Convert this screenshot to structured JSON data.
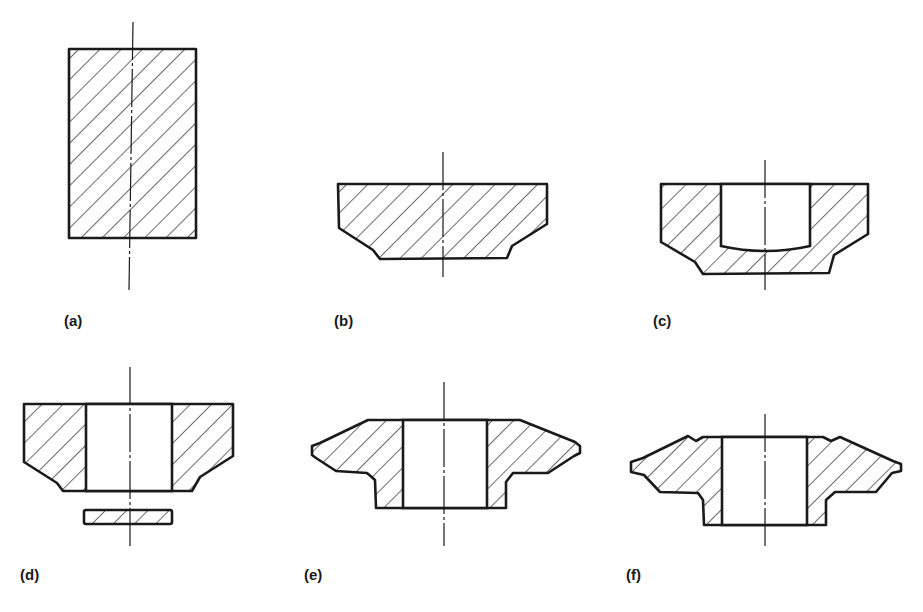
{
  "figure": {
    "panels": [
      {
        "id": "a",
        "label": "(a)",
        "stage": "billet"
      },
      {
        "id": "b",
        "label": "(b)",
        "stage": "upset blank"
      },
      {
        "id": "c",
        "label": "(c)",
        "stage": "pierced blank"
      },
      {
        "id": "d",
        "label": "(d)",
        "stage": "punched out with slug"
      },
      {
        "id": "e",
        "label": "(e)",
        "stage": "flanged forging"
      },
      {
        "id": "f",
        "label": "(f)",
        "stage": "finished forging"
      }
    ],
    "colors": {
      "ink": "#1a1a1a",
      "background": "#ffffff"
    }
  }
}
